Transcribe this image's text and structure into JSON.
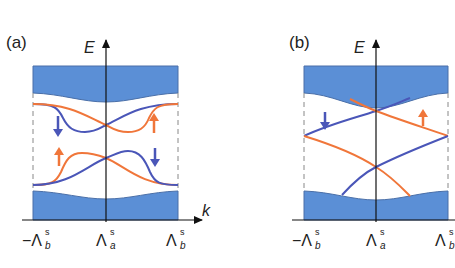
{
  "colors": {
    "band_fill": "#5b8fd6",
    "band_stroke": "#4a6fa8",
    "spin_down": "#4a56b8",
    "spin_up": "#f0763a",
    "axis": "#111111",
    "dashed": "#888888"
  },
  "panels": [
    {
      "id": "a",
      "label": "(a)",
      "y_axis_label": "E",
      "x_axis_label": "k",
      "ticks": [
        {
          "main": "−Λ",
          "sup": "s",
          "sub": "b"
        },
        {
          "main": "Λ",
          "sup": "s",
          "sub": "a"
        },
        {
          "main": "Λ",
          "sup": "s",
          "sub": "b"
        }
      ],
      "arrows": [
        {
          "spin": "down",
          "color": "blue"
        },
        {
          "spin": "up",
          "color": "orange"
        },
        {
          "spin": "up",
          "color": "orange"
        },
        {
          "spin": "down",
          "color": "blue"
        }
      ]
    },
    {
      "id": "b",
      "label": "(b)",
      "y_axis_label": "E",
      "ticks": [
        {
          "main": "−Λ",
          "sup": "s",
          "sub": "b"
        },
        {
          "main": "Λ",
          "sup": "s",
          "sub": "a"
        },
        {
          "main": "Λ",
          "sup": "s",
          "sub": "b"
        }
      ],
      "arrows": [
        {
          "spin": "down",
          "color": "blue"
        },
        {
          "spin": "up",
          "color": "orange"
        }
      ]
    }
  ]
}
